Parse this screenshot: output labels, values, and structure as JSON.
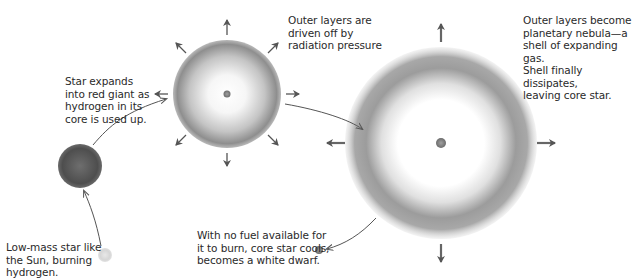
{
  "stages": [
    {
      "id": "main-sequence",
      "label": "Low-mass star like the Sun, burning hydrogen.",
      "lines": [
        "Low-mass star like",
        "the Sun, burning",
        "hydrogen."
      ]
    },
    {
      "id": "red-giant",
      "label": "Star expands into red giant as hydrogen in its core is used up.",
      "lines": [
        "Star expands",
        "into red giant as",
        "hydrogen in its",
        "core is used up."
      ]
    },
    {
      "id": "radiation-pressure",
      "label": "Outer layers are driven off by radiation pressure",
      "lines": [
        "Outer layers are",
        "driven off by",
        "radiation pressure"
      ]
    },
    {
      "id": "planetary-nebula",
      "label": "Outer layers become planetary nebula—a shell of expanding gas. Shell finally dissipates, leaving core star.",
      "lines": [
        "Outer layers become",
        "planetary nebula—a",
        "shell of expanding gas.",
        "Shell finally dissipates,",
        "leaving core star."
      ]
    },
    {
      "id": "white-dwarf",
      "label": "With no fuel available for it to burn, core star cools, becomes a white dwarf.",
      "lines": [
        "With no fuel available for",
        "it to burn, core star cools,",
        "becomes a white dwarf."
      ]
    }
  ],
  "colors": {
    "arrow": "#555555",
    "star_dark": "#4a4a4a",
    "shell_gray": "#8a8a8a",
    "core": "#888888"
  }
}
